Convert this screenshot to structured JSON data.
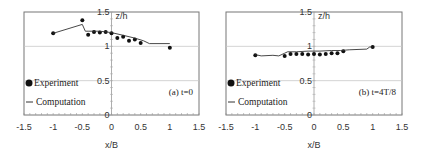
{
  "chart_data": [
    {
      "type": "scatter",
      "panel_label": "(a) t=0",
      "title": "",
      "xlabel": "x/B",
      "ylabel": "z/h",
      "xlim": [
        -1.5,
        1.5
      ],
      "ylim": [
        0,
        1.5
      ],
      "x_ticks": [
        "-1.5",
        "-1",
        "-0.5",
        "0",
        "0.5",
        "1",
        "1.5"
      ],
      "y_ticks": [
        "0",
        "0.5",
        "1",
        "1.5"
      ],
      "grid": true,
      "legend": [
        "Experiment",
        "Computation"
      ],
      "legend_position": "lower-left",
      "series": [
        {
          "name": "Experiment",
          "style": "markers",
          "x": [
            -1.0,
            -0.5,
            -0.4,
            -0.3,
            -0.2,
            -0.1,
            0.0,
            0.1,
            0.2,
            0.3,
            0.4,
            0.5,
            1.0
          ],
          "y": [
            1.19,
            1.38,
            1.17,
            1.21,
            1.2,
            1.21,
            1.19,
            1.12,
            1.14,
            1.08,
            1.1,
            1.05,
            0.98
          ]
        },
        {
          "name": "Computation",
          "style": "line",
          "x": [
            -1.0,
            -0.5,
            -0.45,
            -0.4,
            -0.2,
            0.0,
            0.2,
            0.4,
            0.55,
            0.65,
            1.0
          ],
          "y": [
            1.19,
            1.32,
            1.22,
            1.22,
            1.22,
            1.2,
            1.16,
            1.12,
            1.08,
            1.04,
            1.04
          ]
        }
      ]
    },
    {
      "type": "scatter",
      "panel_label": "(b) t=4T/8",
      "title": "",
      "xlabel": "x/B",
      "ylabel": "z/h",
      "xlim": [
        -1.5,
        1.5
      ],
      "ylim": [
        0,
        1.5
      ],
      "x_ticks": [
        "-1.5",
        "-1",
        "-0.5",
        "0",
        "0.5",
        "1",
        "1.5"
      ],
      "y_ticks": [
        "0",
        "0.5",
        "1",
        "1.5"
      ],
      "grid": true,
      "legend": [
        "Experiment",
        "Computation"
      ],
      "legend_position": "lower-left",
      "series": [
        {
          "name": "Experiment",
          "style": "markers",
          "x": [
            -1.0,
            -0.5,
            -0.4,
            -0.3,
            -0.2,
            -0.1,
            0.0,
            0.1,
            0.2,
            0.3,
            0.4,
            0.5,
            1.0
          ],
          "y": [
            0.87,
            0.86,
            0.89,
            0.89,
            0.89,
            0.88,
            0.89,
            0.88,
            0.89,
            0.9,
            0.9,
            0.93,
            0.99
          ]
        },
        {
          "name": "Computation",
          "style": "line",
          "x": [
            -1.0,
            -0.9,
            -0.7,
            -0.6,
            -0.5,
            -0.45,
            -0.3,
            -0.1,
            0.1,
            0.3,
            0.45,
            0.6,
            0.9,
            0.95,
            1.0
          ],
          "y": [
            0.88,
            0.86,
            0.87,
            0.86,
            0.9,
            0.92,
            0.92,
            0.93,
            0.93,
            0.94,
            0.94,
            0.95,
            0.96,
            0.99,
            0.99
          ]
        }
      ]
    }
  ]
}
